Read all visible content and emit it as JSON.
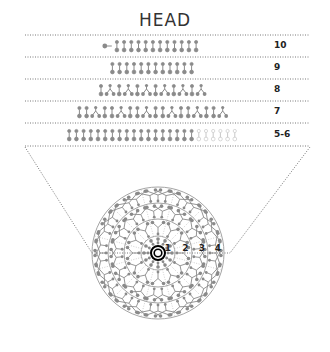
{
  "title": "HEAD",
  "colors": {
    "glyph": "#8a8a8a",
    "glyph_light": "#c8c8c8",
    "dotted_line": "#555555",
    "ring": "#9a9a9a",
    "bullseye": "#000000",
    "text": "#222222"
  },
  "rows": [
    {
      "label": "10",
      "pattern": "T",
      "sequence": [
        "tail",
        "d",
        "d",
        "d",
        "d",
        "d",
        "d",
        "d",
        "d",
        "d",
        "d",
        "d",
        "d"
      ],
      "y": 46
    },
    {
      "label": "9",
      "sequence": [
        "d",
        "d",
        "d",
        "d",
        "d",
        "d",
        "d",
        "d",
        "d",
        "d",
        "d",
        "d"
      ],
      "y": 68
    },
    {
      "label": "8",
      "sequence": [
        "d",
        "A",
        "d",
        "A",
        "d",
        "A",
        "d",
        "A",
        "d",
        "A",
        "d",
        "A"
      ],
      "y": 90
    },
    {
      "label": "7",
      "sequence": [
        "d",
        "d",
        "A",
        "d",
        "d",
        "A",
        "d",
        "d",
        "A",
        "d",
        "d",
        "A",
        "d",
        "d",
        "A",
        "d",
        "d",
        "A"
      ],
      "y": 112
    },
    {
      "label": "5-6",
      "sequence": [
        "d",
        "d",
        "d",
        "d",
        "d",
        "d",
        "d",
        "d",
        "d",
        "d",
        "d",
        "d",
        "d",
        "d",
        "d",
        "d",
        "d",
        "d",
        "o",
        "o",
        "o",
        "o",
        "o",
        "o"
      ],
      "y": 135
    }
  ],
  "row_lines_y": [
    35,
    57,
    79,
    101,
    123,
    146
  ],
  "circle": {
    "center": [
      158,
      253
    ],
    "ring_radii": [
      17,
      34,
      50,
      66
    ],
    "ring_labels": [
      "1",
      "2",
      "3",
      "4"
    ],
    "sectors": 12
  }
}
